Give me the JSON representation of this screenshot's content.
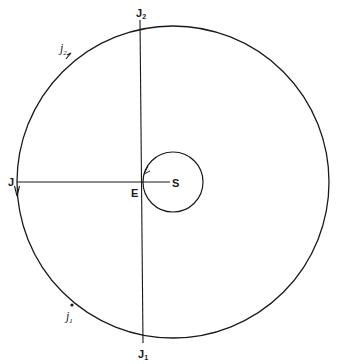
{
  "diagram": {
    "stroke_color": "#1a1a1a",
    "background": "#ffffff",
    "outer_circle": {
      "cx": 173,
      "cy": 182,
      "r": 156
    },
    "inner_circle": {
      "cx": 173,
      "cy": 182,
      "r": 30
    },
    "lines": [
      {
        "name": "line-J-S",
        "x1": 17,
        "y1": 182,
        "x2": 170,
        "y2": 182
      },
      {
        "name": "line-J2-J1",
        "x1": 140,
        "y1": 20,
        "x2": 143,
        "y2": 343
      }
    ],
    "labels": {
      "J2": {
        "main": "J",
        "sub": "2"
      },
      "j2": {
        "main": "j",
        "sub": "2"
      },
      "J": {
        "main": "J"
      },
      "E": {
        "main": "E"
      },
      "S": {
        "main": "S"
      },
      "j1": {
        "main": "j",
        "sub": "1"
      },
      "J1": {
        "main": "J",
        "sub": "1"
      }
    }
  }
}
